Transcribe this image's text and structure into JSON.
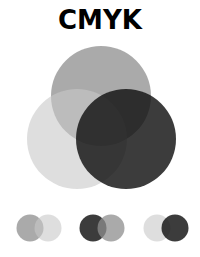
{
  "title": "CMYK",
  "colors": {
    "cyan": "#8e8e8e",
    "magenta": "#d4d4d4",
    "yellow": "#1c1c1c",
    "key": "#000000"
  },
  "main_venn": {
    "circles": [
      {
        "name": "top",
        "cx": 101,
        "cy": 96,
        "r": 50,
        "fill": "#8e8e8e",
        "opacity": 0.75
      },
      {
        "name": "lower-left",
        "cx": 77,
        "cy": 139,
        "r": 50,
        "fill": "#c8c8c8",
        "opacity": 0.6
      },
      {
        "name": "lower-right",
        "cx": 126,
        "cy": 139,
        "r": 50,
        "fill": "#111111",
        "opacity": 0.82
      }
    ]
  },
  "pairs": [
    {
      "left": {
        "cx": 30,
        "cy": 228,
        "r": 13.5,
        "fill": "#8e8e8e",
        "opacity": 0.75
      },
      "right": {
        "cx": 48,
        "cy": 228,
        "r": 13.5,
        "fill": "#c8c8c8",
        "opacity": 0.6
      }
    },
    {
      "left": {
        "cx": 93,
        "cy": 228,
        "r": 13.5,
        "fill": "#111111",
        "opacity": 0.82
      },
      "right": {
        "cx": 111,
        "cy": 228,
        "r": 13.5,
        "fill": "#8e8e8e",
        "opacity": 0.75
      }
    },
    {
      "left": {
        "cx": 157,
        "cy": 228,
        "r": 13.5,
        "fill": "#c8c8c8",
        "opacity": 0.6
      },
      "right": {
        "cx": 175,
        "cy": 228,
        "r": 13.5,
        "fill": "#111111",
        "opacity": 0.82
      }
    }
  ]
}
